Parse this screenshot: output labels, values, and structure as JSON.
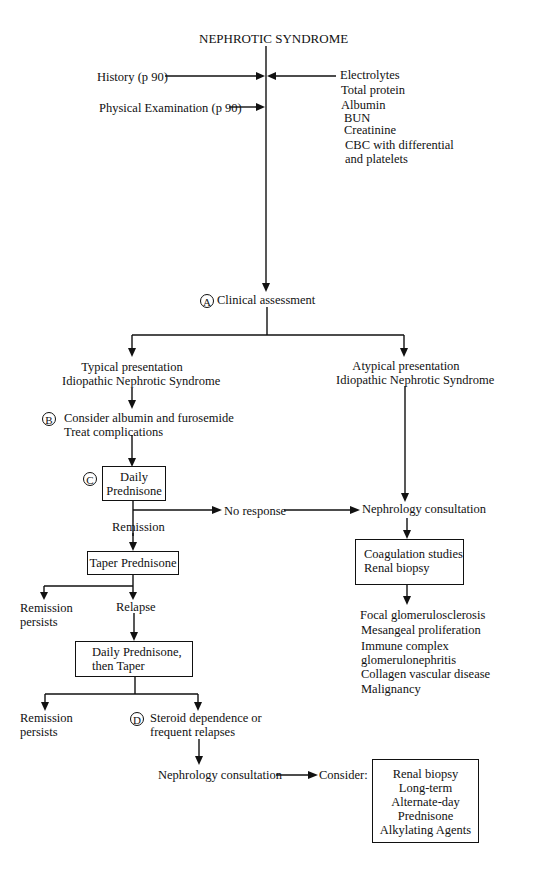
{
  "title": "NEPHROTIC SYNDROME",
  "inputs_left": [
    {
      "label": "History (p 90)"
    },
    {
      "label": "Physical Examination (p 90)"
    }
  ],
  "labs": [
    "Electrolytes",
    "Total protein",
    "Albumin",
    "BUN",
    "Creatinine",
    "CBC with differential",
    "and platelets"
  ],
  "step_a": {
    "marker": "A",
    "label": "Clinical assessment"
  },
  "typical": {
    "line1": "Typical presentation",
    "line2": "Idiopathic Nephrotic Syndrome"
  },
  "atypical": {
    "line1": "Atypical presentation",
    "line2": "Idiopathic Nephrotic Syndrome"
  },
  "step_b": {
    "marker": "B",
    "line1": "Consider albumin and furosemide",
    "line2": "Treat complications"
  },
  "step_c": {
    "marker": "C",
    "line1": "Daily",
    "line2": "Prednisone"
  },
  "no_response": "No response",
  "nephrology_consult_right": "Nephrology consultation",
  "remission": "Remission",
  "taper": "Taper Prednisone",
  "coag_box": {
    "line1": "Coagulation studies",
    "line2": "Renal biopsy"
  },
  "remission_persists_1": {
    "line1": "Remission",
    "line2": "persists"
  },
  "relapse": "Relapse",
  "daily_then_taper": {
    "line1": "Daily Prednisone,",
    "line2": "then Taper"
  },
  "biopsy_findings": [
    "Focal glomerulosclerosis",
    "Mesangeal proliferation",
    "Immune complex",
    "glomerulonephritis",
    "Collagen vascular disease",
    "Malignancy"
  ],
  "remission_persists_2": {
    "line1": "Remission",
    "line2": "persists"
  },
  "step_d": {
    "marker": "D",
    "line1": "Steroid dependence or",
    "line2": "frequent relapses"
  },
  "nephrology_consult_bottom": "Nephrology consultation",
  "consider": "Consider:",
  "consider_box": [
    "Renal biopsy",
    "Long-term",
    "Alternate-day",
    "Prednisone",
    "Alkylating Agents"
  ]
}
